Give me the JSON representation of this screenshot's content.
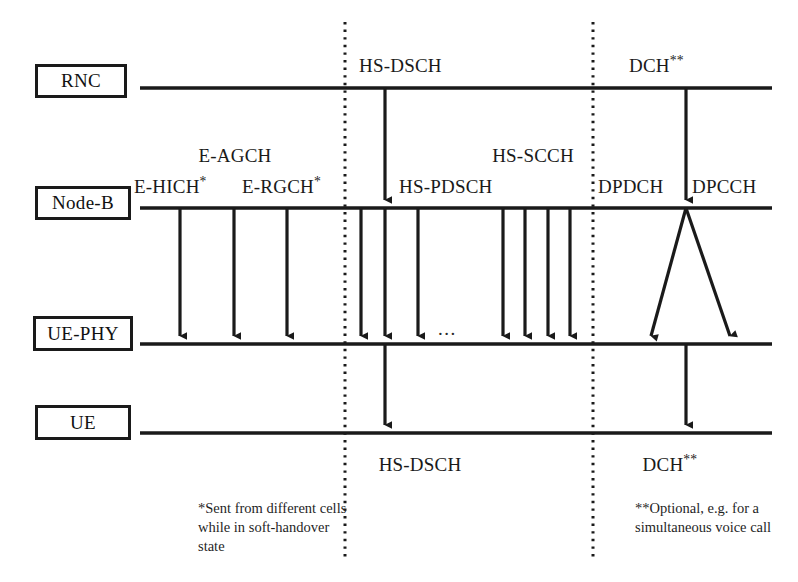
{
  "diagram": {
    "colors": {
      "line": "#1a1a1a",
      "background": "#ffffff",
      "text": "#1a1a1a",
      "divider": "#1a1a1a"
    },
    "nodes": [
      {
        "id": "rnc",
        "label": "RNC"
      },
      {
        "id": "nodeb",
        "label": "Node-B"
      },
      {
        "id": "uephy",
        "label": "UE-PHY"
      },
      {
        "id": "ue",
        "label": "UE"
      }
    ],
    "labels": {
      "hs_dsch_top": "HS-DSCH",
      "dch_top": "DCH",
      "dch_top_marker": "**",
      "e_agch": "E-AGCH",
      "e_hich": "E-HICH",
      "e_hich_marker": "*",
      "e_rgch": "E-RGCH",
      "e_rgch_marker": "*",
      "hs_pdsch": "HS-PDSCH",
      "hs_scch": "HS-SCCH",
      "dpdch": "DPDCH",
      "dpcch": "DPCCH",
      "ellipsis": "...",
      "hs_dsch_bottom": "HS-DSCH",
      "dch_bottom": "DCH",
      "dch_bottom_marker": "**"
    },
    "footnotes": [
      {
        "id": "single-star",
        "text": "*Sent from different cells while in soft-handover state"
      },
      {
        "id": "double-star",
        "text": "**Optional, e.g. for a simultaneous voice call"
      }
    ],
    "section_dividers": [
      {
        "id": "divider-left",
        "style": "dotted"
      },
      {
        "id": "divider-right",
        "style": "dotted"
      }
    ]
  }
}
